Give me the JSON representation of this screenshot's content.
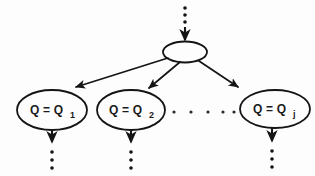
{
  "diagram": {
    "background_color": "#fdfdfd",
    "stroke_color": "#141414",
    "root": {
      "name": "root-node",
      "label": "",
      "cx": 185,
      "cy": 52,
      "rx": 22,
      "ry": 10.5
    },
    "incoming_arrow": {
      "name": "root-incoming-arrow",
      "dots": [
        {
          "cx": 185,
          "cy": 8
        },
        {
          "cx": 185,
          "cy": 15
        },
        {
          "cx": 185,
          "cy": 22
        }
      ],
      "line": {
        "x1": 185,
        "y1": 27,
        "x2": 185,
        "y2": 40
      }
    },
    "children": [
      {
        "name": "child-node-1",
        "label_main": "Q = Q",
        "label_sub": "1",
        "cx": 52,
        "cy": 110,
        "rx": 35,
        "ry": 20,
        "edge": {
          "x1": 168,
          "y1": 58,
          "x2": 70,
          "y2": 89
        },
        "stub": {
          "line": {
            "x1": 52,
            "y1": 130,
            "x2": 52,
            "y2": 142
          },
          "dots": [
            {
              "cx": 52,
              "cy": 152
            },
            {
              "cx": 52,
              "cy": 160
            },
            {
              "cx": 52,
              "cy": 168
            }
          ]
        }
      },
      {
        "name": "child-node-2",
        "label_main": "Q = Q",
        "label_sub": "2",
        "cx": 131,
        "cy": 110,
        "rx": 34,
        "ry": 20,
        "edge": {
          "x1": 180,
          "y1": 62,
          "x2": 148,
          "y2": 90
        },
        "stub": {
          "line": {
            "x1": 131,
            "y1": 130,
            "x2": 131,
            "y2": 142
          },
          "dots": [
            {
              "cx": 131,
              "cy": 152
            },
            {
              "cx": 131,
              "cy": 160
            },
            {
              "cx": 131,
              "cy": 168
            }
          ]
        }
      },
      {
        "name": "child-node-j",
        "label_main": "Q = Q",
        "label_sub": "j",
        "cx": 275,
        "cy": 109,
        "rx": 35,
        "ry": 19,
        "edge": {
          "x1": 199,
          "y1": 61,
          "x2": 242,
          "y2": 89
        },
        "stub": {
          "line": {
            "x1": 272,
            "y1": 128,
            "x2": 272,
            "y2": 141
          },
          "dots": [
            {
              "cx": 272,
              "cy": 151
            },
            {
              "cx": 272,
              "cy": 159
            },
            {
              "cx": 272,
              "cy": 167
            }
          ]
        }
      }
    ],
    "horizontal_ellipsis": {
      "name": "horizontal-ellipsis",
      "dots": [
        {
          "cx": 174,
          "cy": 112
        },
        {
          "cx": 191,
          "cy": 112
        },
        {
          "cx": 208,
          "cy": 112
        },
        {
          "cx": 223,
          "cy": 112
        },
        {
          "cx": 234,
          "cy": 112
        }
      ],
      "radius": 1.6
    },
    "dot_radius_vertical": 1.8
  }
}
